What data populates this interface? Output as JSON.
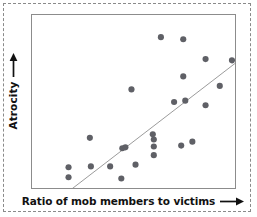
{
  "chart_data": {
    "type": "scatter",
    "title": "",
    "xlabel": "Ratio of mob members to victims",
    "ylabel": "Atrocity",
    "xlim": [
      0,
      1
    ],
    "ylim": [
      0,
      1
    ],
    "grid": false,
    "legend": null,
    "axis_ticks": {
      "x": [],
      "y": []
    },
    "point_color": "#5f6066",
    "point_radius": 3.1,
    "trendline": {
      "visible": true,
      "color": "#9a9a9a",
      "width": 1,
      "x": [
        0.18,
        1.0
      ],
      "y": [
        -0.02,
        0.72
      ]
    },
    "points": [
      {
        "x": 0.635,
        "y": 0.872
      },
      {
        "x": 0.745,
        "y": 0.86
      },
      {
        "x": 0.855,
        "y": 0.745
      },
      {
        "x": 0.985,
        "y": 0.738
      },
      {
        "x": 0.745,
        "y": 0.645
      },
      {
        "x": 0.925,
        "y": 0.59
      },
      {
        "x": 0.49,
        "y": 0.57
      },
      {
        "x": 0.7,
        "y": 0.497
      },
      {
        "x": 0.755,
        "y": 0.505
      },
      {
        "x": 0.855,
        "y": 0.478
      },
      {
        "x": 0.285,
        "y": 0.29
      },
      {
        "x": 0.6,
        "y": 0.28
      },
      {
        "x": 0.6,
        "y": 0.24
      },
      {
        "x": 0.79,
        "y": 0.268
      },
      {
        "x": 0.595,
        "y": 0.31
      },
      {
        "x": 0.445,
        "y": 0.23
      },
      {
        "x": 0.46,
        "y": 0.235
      },
      {
        "x": 0.29,
        "y": 0.125
      },
      {
        "x": 0.18,
        "y": 0.12
      },
      {
        "x": 0.6,
        "y": 0.19
      },
      {
        "x": 0.51,
        "y": 0.135
      },
      {
        "x": 0.385,
        "y": 0.125
      },
      {
        "x": 0.18,
        "y": 0.062
      },
      {
        "x": 0.44,
        "y": 0.055
      },
      {
        "x": 0.735,
        "y": 0.245
      }
    ]
  },
  "axes": {
    "x_label_text": "Ratio of mob members to victims",
    "y_label_text": "Atrocity",
    "x_arrow_icon": "right-arrow-icon",
    "y_arrow_icon": "up-arrow-icon"
  },
  "frame": {
    "outer_border_color": "#8a8a8a",
    "plot_border_color": "#8c8c8c",
    "background_color": "#ffffff"
  }
}
